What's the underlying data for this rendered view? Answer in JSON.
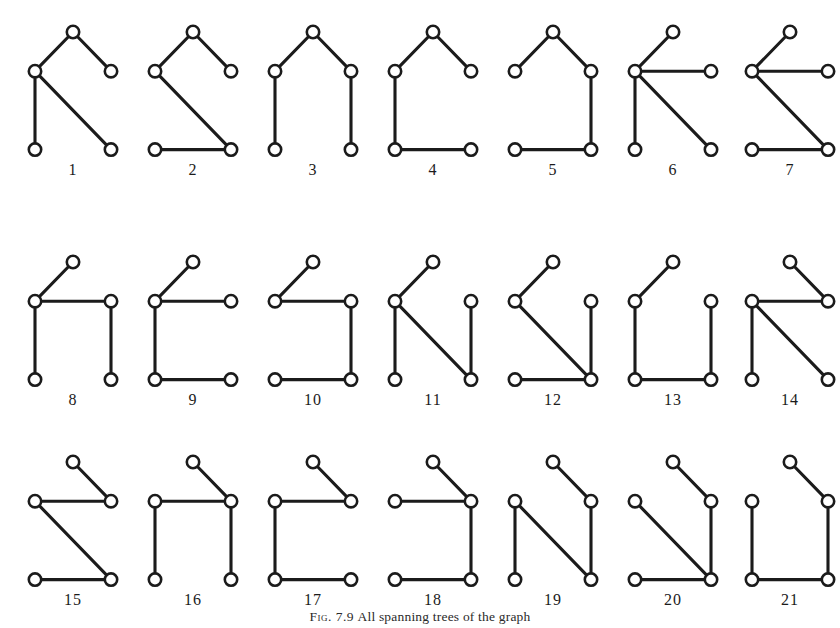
{
  "page": {
    "width": 840,
    "height": 628,
    "background": "#ffffff",
    "ink_color": "#1b1b1b",
    "node_fill": "#ffffff"
  },
  "caption": {
    "tag": "Fig. 7.9",
    "text": "All spanning trees of the graph"
  },
  "figure_plate": {
    "columns": 7,
    "rows": 3,
    "cell_width": 120,
    "cell_height": 200,
    "grid_unit_x": 38,
    "grid_unit_y": 40,
    "node_radius": 6.2,
    "label_offset_y": 25
  },
  "chart_data": {
    "type": "diagram",
    "title": "All spanning trees of the graph",
    "figures": [
      {
        "label": "1",
        "row": 0,
        "col": 0,
        "nodes": [
          [
            1,
            0
          ],
          [
            0,
            1
          ],
          [
            2,
            1
          ],
          [
            0,
            3
          ],
          [
            2,
            3
          ]
        ],
        "edges": [
          [
            0,
            1
          ],
          [
            0,
            2
          ],
          [
            1,
            3
          ],
          [
            1,
            4
          ]
        ]
      },
      {
        "label": "2",
        "row": 0,
        "col": 1,
        "nodes": [
          [
            1,
            0
          ],
          [
            0,
            1
          ],
          [
            2,
            1
          ],
          [
            0,
            3
          ],
          [
            2,
            3
          ]
        ],
        "edges": [
          [
            0,
            1
          ],
          [
            0,
            2
          ],
          [
            1,
            4
          ],
          [
            3,
            4
          ]
        ]
      },
      {
        "label": "3",
        "row": 0,
        "col": 2,
        "nodes": [
          [
            1,
            0
          ],
          [
            0,
            1
          ],
          [
            2,
            1
          ],
          [
            0,
            3
          ],
          [
            2,
            3
          ]
        ],
        "edges": [
          [
            0,
            1
          ],
          [
            0,
            2
          ],
          [
            1,
            3
          ],
          [
            2,
            4
          ]
        ]
      },
      {
        "label": "4",
        "row": 0,
        "col": 3,
        "nodes": [
          [
            1,
            0
          ],
          [
            0,
            1
          ],
          [
            2,
            1
          ],
          [
            0,
            3
          ],
          [
            2,
            3
          ]
        ],
        "edges": [
          [
            0,
            1
          ],
          [
            0,
            2
          ],
          [
            1,
            3
          ],
          [
            3,
            4
          ]
        ]
      },
      {
        "label": "5",
        "row": 0,
        "col": 4,
        "nodes": [
          [
            1,
            0
          ],
          [
            0,
            1
          ],
          [
            2,
            1
          ],
          [
            0,
            3
          ],
          [
            2,
            3
          ]
        ],
        "edges": [
          [
            0,
            1
          ],
          [
            0,
            2
          ],
          [
            2,
            4
          ],
          [
            3,
            4
          ]
        ]
      },
      {
        "label": "6",
        "row": 0,
        "col": 5,
        "nodes": [
          [
            1,
            0
          ],
          [
            0,
            1
          ],
          [
            2,
            1
          ],
          [
            0,
            3
          ],
          [
            2,
            3
          ]
        ],
        "edges": [
          [
            0,
            1
          ],
          [
            1,
            2
          ],
          [
            1,
            3
          ],
          [
            1,
            4
          ]
        ]
      },
      {
        "label": "7",
        "row": 0,
        "col": 6,
        "nodes": [
          [
            1,
            0
          ],
          [
            0,
            1
          ],
          [
            2,
            1
          ],
          [
            0,
            3
          ],
          [
            2,
            3
          ]
        ],
        "edges": [
          [
            0,
            1
          ],
          [
            1,
            2
          ],
          [
            1,
            4
          ],
          [
            3,
            4
          ]
        ]
      },
      {
        "label": "8",
        "row": 1,
        "col": 0,
        "nodes": [
          [
            1,
            0
          ],
          [
            0,
            1
          ],
          [
            2,
            1
          ],
          [
            0,
            3
          ],
          [
            2,
            3
          ]
        ],
        "edges": [
          [
            0,
            1
          ],
          [
            1,
            2
          ],
          [
            1,
            3
          ],
          [
            2,
            4
          ]
        ]
      },
      {
        "label": "9",
        "row": 1,
        "col": 1,
        "nodes": [
          [
            1,
            0
          ],
          [
            0,
            1
          ],
          [
            2,
            1
          ],
          [
            0,
            3
          ],
          [
            2,
            3
          ]
        ],
        "edges": [
          [
            0,
            1
          ],
          [
            1,
            2
          ],
          [
            1,
            3
          ],
          [
            3,
            4
          ]
        ]
      },
      {
        "label": "10",
        "row": 1,
        "col": 2,
        "nodes": [
          [
            1,
            0
          ],
          [
            0,
            1
          ],
          [
            2,
            1
          ],
          [
            0,
            3
          ],
          [
            2,
            3
          ]
        ],
        "edges": [
          [
            0,
            1
          ],
          [
            1,
            2
          ],
          [
            2,
            4
          ],
          [
            3,
            4
          ]
        ]
      },
      {
        "label": "11",
        "row": 1,
        "col": 3,
        "nodes": [
          [
            1,
            0
          ],
          [
            0,
            1
          ],
          [
            2,
            1
          ],
          [
            0,
            3
          ],
          [
            2,
            3
          ]
        ],
        "edges": [
          [
            0,
            1
          ],
          [
            1,
            3
          ],
          [
            1,
            4
          ],
          [
            2,
            4
          ]
        ]
      },
      {
        "label": "12",
        "row": 1,
        "col": 4,
        "nodes": [
          [
            1,
            0
          ],
          [
            0,
            1
          ],
          [
            2,
            1
          ],
          [
            0,
            3
          ],
          [
            2,
            3
          ]
        ],
        "edges": [
          [
            0,
            1
          ],
          [
            1,
            4
          ],
          [
            2,
            4
          ],
          [
            3,
            4
          ]
        ]
      },
      {
        "label": "13",
        "row": 1,
        "col": 5,
        "nodes": [
          [
            1,
            0
          ],
          [
            0,
            1
          ],
          [
            2,
            1
          ],
          [
            0,
            3
          ],
          [
            2,
            3
          ]
        ],
        "edges": [
          [
            0,
            1
          ],
          [
            1,
            3
          ],
          [
            2,
            4
          ],
          [
            3,
            4
          ]
        ]
      },
      {
        "label": "14",
        "row": 1,
        "col": 6,
        "nodes": [
          [
            1,
            0
          ],
          [
            0,
            1
          ],
          [
            2,
            1
          ],
          [
            0,
            3
          ],
          [
            2,
            3
          ]
        ],
        "edges": [
          [
            0,
            2
          ],
          [
            1,
            2
          ],
          [
            1,
            3
          ],
          [
            1,
            4
          ]
        ]
      },
      {
        "label": "15",
        "row": 2,
        "col": 0,
        "nodes": [
          [
            1,
            0
          ],
          [
            0,
            1
          ],
          [
            2,
            1
          ],
          [
            0,
            3
          ],
          [
            2,
            3
          ]
        ],
        "edges": [
          [
            0,
            2
          ],
          [
            1,
            2
          ],
          [
            1,
            4
          ],
          [
            3,
            4
          ]
        ]
      },
      {
        "label": "16",
        "row": 2,
        "col": 1,
        "nodes": [
          [
            1,
            0
          ],
          [
            0,
            1
          ],
          [
            2,
            1
          ],
          [
            0,
            3
          ],
          [
            2,
            3
          ]
        ],
        "edges": [
          [
            0,
            2
          ],
          [
            1,
            2
          ],
          [
            1,
            3
          ],
          [
            2,
            4
          ]
        ]
      },
      {
        "label": "17",
        "row": 2,
        "col": 2,
        "nodes": [
          [
            1,
            0
          ],
          [
            0,
            1
          ],
          [
            2,
            1
          ],
          [
            0,
            3
          ],
          [
            2,
            3
          ]
        ],
        "edges": [
          [
            0,
            2
          ],
          [
            1,
            2
          ],
          [
            1,
            3
          ],
          [
            3,
            4
          ]
        ]
      },
      {
        "label": "18",
        "row": 2,
        "col": 3,
        "nodes": [
          [
            1,
            0
          ],
          [
            0,
            1
          ],
          [
            2,
            1
          ],
          [
            0,
            3
          ],
          [
            2,
            3
          ]
        ],
        "edges": [
          [
            0,
            2
          ],
          [
            1,
            2
          ],
          [
            2,
            4
          ],
          [
            3,
            4
          ]
        ]
      },
      {
        "label": "19",
        "row": 2,
        "col": 4,
        "nodes": [
          [
            1,
            0
          ],
          [
            0,
            1
          ],
          [
            2,
            1
          ],
          [
            0,
            3
          ],
          [
            2,
            3
          ]
        ],
        "edges": [
          [
            0,
            2
          ],
          [
            1,
            3
          ],
          [
            1,
            4
          ],
          [
            2,
            4
          ]
        ]
      },
      {
        "label": "20",
        "row": 2,
        "col": 5,
        "nodes": [
          [
            1,
            0
          ],
          [
            0,
            1
          ],
          [
            2,
            1
          ],
          [
            0,
            3
          ],
          [
            2,
            3
          ]
        ],
        "edges": [
          [
            0,
            2
          ],
          [
            1,
            4
          ],
          [
            2,
            4
          ],
          [
            3,
            4
          ]
        ]
      },
      {
        "label": "21",
        "row": 2,
        "col": 6,
        "nodes": [
          [
            1,
            0
          ],
          [
            0,
            1
          ],
          [
            2,
            1
          ],
          [
            0,
            3
          ],
          [
            2,
            3
          ]
        ],
        "edges": [
          [
            0,
            2
          ],
          [
            1,
            3
          ],
          [
            2,
            4
          ],
          [
            3,
            4
          ]
        ]
      }
    ]
  }
}
